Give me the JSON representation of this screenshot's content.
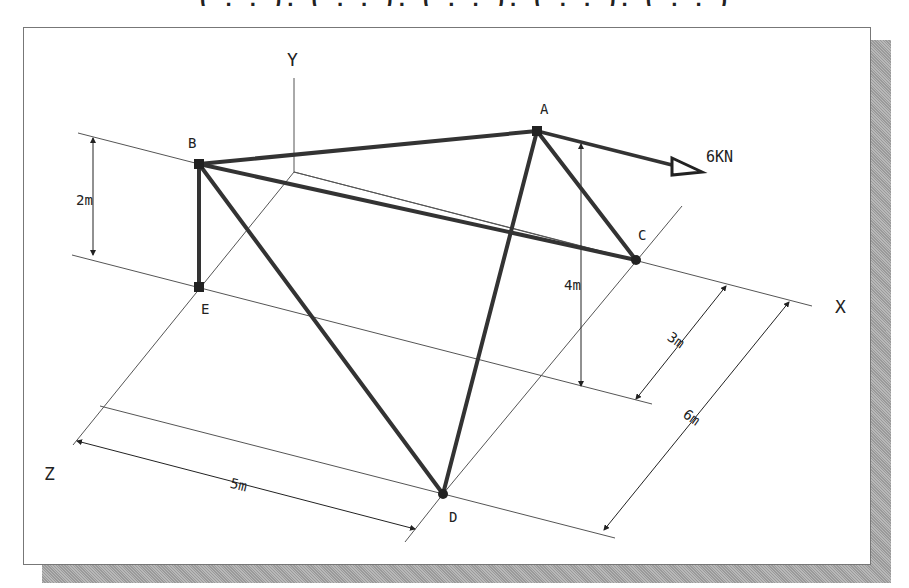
{
  "header": {
    "clipped_text": "( , , ), ( , , ), ( , , ), ( , , ), ( , , )"
  },
  "diagram": {
    "axes": {
      "x": "X",
      "y": "Y",
      "z": "Z"
    },
    "nodes": [
      {
        "id": "A",
        "label": "A",
        "x": 537,
        "y": 131
      },
      {
        "id": "B",
        "label": "B",
        "x": 199,
        "y": 164
      },
      {
        "id": "C",
        "label": "C",
        "x": 636,
        "y": 260
      },
      {
        "id": "D",
        "label": "D",
        "x": 443,
        "y": 494
      },
      {
        "id": "E",
        "label": "E",
        "x": 199,
        "y": 287
      }
    ],
    "members": [
      [
        "A",
        "B"
      ],
      [
        "A",
        "C"
      ],
      [
        "A",
        "D"
      ],
      [
        "B",
        "C"
      ],
      [
        "B",
        "D"
      ],
      [
        "B",
        "E"
      ]
    ],
    "load": {
      "label": "6KN",
      "from": [
        537,
        131
      ],
      "to": [
        700,
        172
      ]
    },
    "dimensions": [
      {
        "label": "2m"
      },
      {
        "label": "4m"
      },
      {
        "label": "3m"
      },
      {
        "label": "6m"
      },
      {
        "label": "5m"
      }
    ]
  }
}
